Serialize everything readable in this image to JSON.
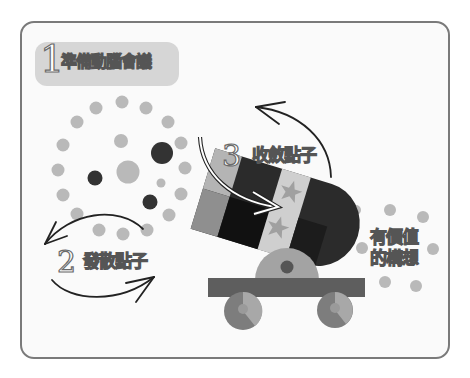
{
  "diagram": {
    "steps": [
      {
        "number": "1",
        "label": "準備動腦會議"
      },
      {
        "number": "2",
        "label": "發散點子"
      },
      {
        "number": "3",
        "label": "收斂點子"
      }
    ],
    "result": {
      "line1": "有價值",
      "line2": "的構想"
    },
    "colors": {
      "frame_border": "#7a7a7a",
      "pill_bg": "#d6d6d6",
      "dot_light": "#b9b9b9",
      "dot_dark": "#333333",
      "cannon_dark": "#2b2b2b",
      "cannon_mid": "#8c8c8c",
      "cannon_light": "#c8c8c8",
      "cart": "#5e5e5e"
    }
  }
}
